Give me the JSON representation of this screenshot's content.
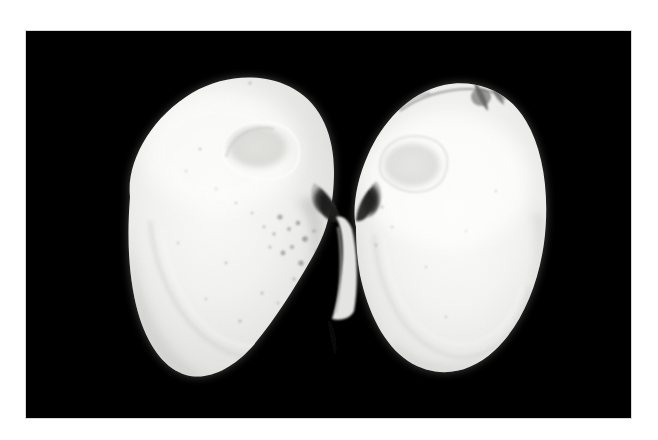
{
  "image": {
    "title": "Bivalve shell specimen, both valves opened",
    "subject": "clam shell (bivalve mollusc), interior of left and right valves",
    "capture_style": "grayscale photograph on black background",
    "canvas": {
      "width": 658,
      "height": 440
    },
    "background_page_color": "#ffffff"
  },
  "photo_plate": {
    "name": "black background field",
    "color": "#000000",
    "x": 26,
    "y": 31,
    "width": 605,
    "height": 387,
    "edge_color": "#d8d8d8"
  },
  "palette": {
    "background_black": "#000000",
    "page_white": "#ffffff",
    "shell_highlight": "#fbfbf9",
    "shell_base": "#ececeb",
    "shell_midtone": "#dedede",
    "shell_shadow": "#c4c4c4",
    "scar_gray": "#d6d6d4",
    "speckle_gray": "#9a9a9a",
    "hinge_dark": "#2b2b2b",
    "margin_soft_gray": "#b8b8b8"
  },
  "specimens": [
    {
      "id": "left-valve",
      "label": "Left valve (interior view)",
      "orientation": "umbo toward upper right, ventral margin lower left",
      "bounds": {
        "x": 118,
        "y": 78,
        "width": 215,
        "height": 300
      },
      "features": [
        {
          "name": "anterior-adductor-muscle-scar",
          "shape": "oval",
          "cx": 258,
          "cy": 145,
          "rx": 33,
          "ry": 22,
          "tone": "#dcdcda"
        },
        {
          "name": "pallial-line",
          "description": "faint arc parallel to ventral margin"
        },
        {
          "name": "speckle-field",
          "description": "scattered dark gray flecks near posterior",
          "cx": 285,
          "cy": 215
        },
        {
          "name": "hinge-notch",
          "description": "dark wedge at umbo where valves meet",
          "cx": 324,
          "cy": 202
        }
      ]
    },
    {
      "id": "right-valve",
      "label": "Right valve (interior view)",
      "orientation": "umbo toward upper left, ventral margin lower right",
      "bounds": {
        "x": 330,
        "y": 85,
        "width": 220,
        "height": 288
      },
      "features": [
        {
          "name": "posterior-adductor-muscle-scar",
          "shape": "oval",
          "cx": 410,
          "cy": 163,
          "rx": 32,
          "ry": 24,
          "tone": "#dedede"
        },
        {
          "name": "dorsal-margin-dark-marking",
          "description": "dark streaked damage / periostracum along dorsal edge",
          "x": 395,
          "y": 88,
          "width": 85,
          "height": 22
        },
        {
          "name": "hinge-tooth",
          "description": "dark wedge at umbo where valves meet",
          "cx": 345,
          "cy": 200
        },
        {
          "name": "pallial-line",
          "description": "faint arc parallel to ventral margin"
        }
      ]
    }
  ],
  "artifacts": [
    {
      "name": "dust-speck",
      "x": 250,
      "y": 83,
      "size": 2,
      "color": "#b9b9b9"
    },
    {
      "name": "hinge-bridge",
      "description": "thin pale ligament bridge linking the two valves",
      "x": 322,
      "y": 212,
      "width": 14,
      "height": 70
    }
  ]
}
